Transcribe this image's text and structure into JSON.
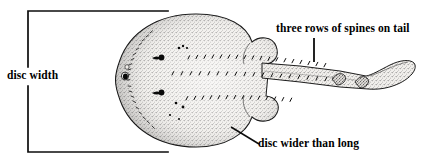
{
  "figure": {
    "colors": {
      "ink": "#000000",
      "background": "#ffffff",
      "stipple": "#6b6b6b",
      "body_fill": "#e8e6e2"
    }
  },
  "annotations": {
    "disc_width": {
      "label": "disc width",
      "icon": "measurement-bracket-icon"
    },
    "spines_on_tail": {
      "label": "three rows of spines on tail",
      "icon": "vertical-leader-line-icon"
    },
    "disc_wider_than_long": {
      "label": "disc wider than long",
      "icon": "diagonal-leader-line-icon"
    }
  },
  "specimen": {
    "parts": {
      "disc": "disc",
      "eye": "eye",
      "spiracle": "spiracle",
      "pelvic_fin": "pelvic-fin",
      "tail": "tail",
      "dorsal_fin": "dorsal-fin",
      "caudal_fin": "caudal-fin",
      "spine_rows": "spine-rows"
    },
    "spine_row_count": "3"
  }
}
